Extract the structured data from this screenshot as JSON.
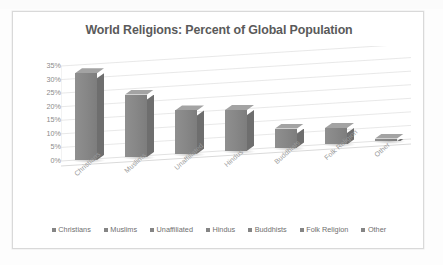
{
  "chart_data": {
    "type": "bar",
    "title": "World Religions: Percent of Global Population",
    "xlabel": "",
    "ylabel": "",
    "categories": [
      "Christians",
      "Muslims",
      "Unaffiliated",
      "Hindus",
      "Buddhists",
      "Folk Religion",
      "Other"
    ],
    "values": [
      32,
      23,
      16,
      15,
      7,
      6,
      1
    ],
    "ylim": [
      0,
      35
    ],
    "ytick_labels": [
      "35%",
      "30%",
      "25%",
      "20%",
      "15%",
      "10%",
      "5%",
      "0%"
    ],
    "ytick_values": [
      35,
      30,
      25,
      20,
      15,
      10,
      5,
      0
    ],
    "grid": true,
    "legend_position": "bottom",
    "legend": [
      "Christians",
      "Muslims",
      "Unaffiliated",
      "Hindus",
      "Buddhists",
      "Folk Religion",
      "Other"
    ],
    "style": "3d-column",
    "series": [
      {
        "name": "Percent of Global Population",
        "values": [
          32,
          23,
          16,
          15,
          7,
          6,
          1
        ]
      }
    ]
  },
  "colors": {
    "bar_front": "#888888",
    "bar_side": "#6e6e6e",
    "bar_top": "#a3a3a3",
    "title_text": "#5a5a5a",
    "axis_text": "#8a8a8a",
    "legend_text": "#6f6f6f",
    "frame_border": "#d9d9d9",
    "plot_background": "#ffffff"
  }
}
